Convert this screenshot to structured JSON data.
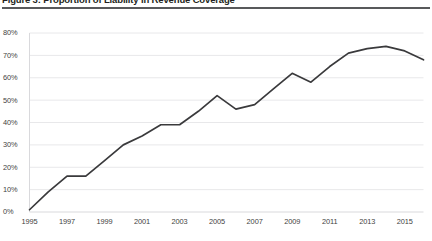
{
  "figure": {
    "title": "Figure 3: Proportion of Liability in Revenue Coverage",
    "rule_color": "#58595b"
  },
  "chart_data": {
    "type": "line",
    "title": "Figure 3: Proportion of Liability in Revenue Coverage",
    "xlabel": "",
    "ylabel": "",
    "x": [
      1995,
      1996,
      1997,
      1998,
      1999,
      2000,
      2001,
      2002,
      2003,
      2004,
      2005,
      2006,
      2007,
      2008,
      2009,
      2010,
      2011,
      2012,
      2013,
      2014,
      2015,
      2016
    ],
    "values": [
      1,
      9,
      16,
      16,
      23,
      30,
      34,
      39,
      39,
      45,
      52,
      46,
      48,
      55,
      62,
      58,
      65,
      71,
      73,
      74,
      72,
      68
    ],
    "series": [
      {
        "name": "Proportion of liability in revenue coverage",
        "values": [
          1,
          9,
          16,
          16,
          23,
          30,
          34,
          39,
          39,
          45,
          52,
          46,
          48,
          55,
          62,
          58,
          65,
          71,
          73,
          74,
          72,
          68
        ]
      }
    ],
    "ylim": [
      0,
      80
    ],
    "yticks": [
      0,
      10,
      20,
      30,
      40,
      50,
      60,
      70,
      80
    ],
    "ytick_labels": [
      "0%",
      "10%",
      "20%",
      "30%",
      "40%",
      "50%",
      "60%",
      "70%",
      "80%"
    ],
    "xlim": [
      1995,
      2016
    ],
    "xticks": [
      1995,
      1997,
      1999,
      2001,
      2003,
      2005,
      2007,
      2009,
      2011,
      2013,
      2015
    ],
    "xtick_labels": [
      "1995",
      "1997",
      "1999",
      "2001",
      "2003",
      "2005",
      "2007",
      "2009",
      "2011",
      "2013",
      "2015"
    ],
    "grid": true,
    "grid_axis": "y",
    "legend": false,
    "legend_position": "none",
    "line_color": "#3a3a3c",
    "grid_color": "#e8e8ea",
    "axis_color": "#d9d9dc"
  }
}
